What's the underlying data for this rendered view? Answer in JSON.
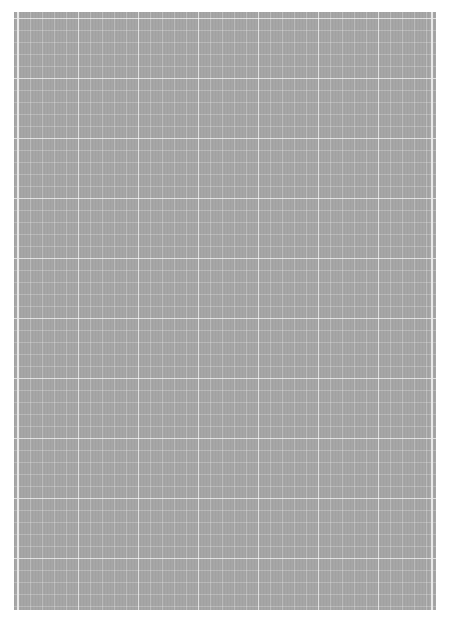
{
  "page": {
    "type": "grid-paper",
    "background_color": "#ffffff",
    "sheet_color": "#a6a6a6",
    "grid_line_color": "#ffffff",
    "minor_spacing_px": 12,
    "major_spacing_px": 60
  }
}
